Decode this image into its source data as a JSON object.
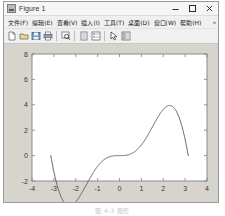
{
  "window": {
    "title": "Figure 1",
    "icon": "matlab-figure-icon",
    "controls": [
      {
        "name": "minimize-button",
        "glyph": "minimize-icon"
      },
      {
        "name": "maximize-button",
        "glyph": "maximize-icon"
      },
      {
        "name": "close-button",
        "glyph": "close-icon"
      }
    ]
  },
  "menubar": {
    "items": [
      {
        "name": "menu-file",
        "label": "文件(F)"
      },
      {
        "name": "menu-edit",
        "label": "编辑(E)"
      },
      {
        "name": "menu-view",
        "label": "查看(V)"
      },
      {
        "name": "menu-insert",
        "label": "插入(I)"
      },
      {
        "name": "menu-tools",
        "label": "工具(T)"
      },
      {
        "name": "menu-desktop",
        "label": "桌面(D)"
      },
      {
        "name": "menu-window",
        "label": "窗口(W)"
      },
      {
        "name": "menu-help",
        "label": "帮助(H)"
      }
    ],
    "overflow_label": "»"
  },
  "toolbar": {
    "buttons": [
      {
        "name": "new-figure-button",
        "icon": "new-document-icon"
      },
      {
        "name": "open-file-button",
        "icon": "open-folder-icon"
      },
      {
        "name": "save-figure-button",
        "icon": "save-disk-icon"
      },
      {
        "name": "print-figure-button",
        "icon": "printer-icon"
      },
      {
        "name": "zoom-in-button",
        "icon": "magnifier-plus-icon"
      },
      {
        "name": "data-cursor-button",
        "icon": "data-cursor-icon"
      },
      {
        "name": "insert-legend-button",
        "icon": "legend-icon"
      },
      {
        "name": "edit-plot-button",
        "icon": "arrow-pointer-icon"
      },
      {
        "name": "insert-colorbar-button",
        "icon": "colorbar-icon"
      }
    ]
  },
  "caption": {
    "text": "图 4-3  图形"
  },
  "chart_data": {
    "type": "line",
    "title": "",
    "xlabel": "",
    "ylabel": "",
    "xlim": [
      -4,
      4
    ],
    "ylim": [
      -2,
      8
    ],
    "xticks": [
      -4,
      -3,
      -2,
      -1,
      0,
      1,
      2,
      3,
      4
    ],
    "yticks": [
      -2,
      0,
      2,
      4,
      6,
      8
    ],
    "xticklabels": [
      "-4",
      "-3",
      "-2",
      "-1",
      "0",
      "1",
      "2",
      "3",
      "4"
    ],
    "yticklabels": [
      "-2",
      "0",
      "2",
      "4",
      "6",
      "8"
    ],
    "grid": false,
    "legend": null,
    "box": true,
    "line_color": "#555555",
    "axes_color": "#808080",
    "axes_bg": "#ffffff",
    "figure_bg": "#d7d4cd",
    "series": [
      {
        "name": "x^2*sin(x)",
        "x": [
          -3.1416,
          -3.0,
          -2.8,
          -2.6,
          -2.4,
          -2.2,
          -2.0,
          -1.8,
          -1.6,
          -1.4,
          -1.2,
          -1.0,
          -0.8,
          -0.6,
          -0.4,
          -0.2,
          0.0,
          0.2,
          0.4,
          0.6,
          0.8,
          1.0,
          1.2,
          1.4,
          1.6,
          1.8,
          2.0,
          2.2,
          2.3,
          2.4,
          2.6,
          2.8,
          3.0,
          3.1416
        ],
        "y": [
          0.0,
          -1.39,
          -2.64,
          -3.49,
          -3.89,
          -3.91,
          -3.64,
          -3.16,
          -2.56,
          -1.93,
          -1.34,
          -0.84,
          -0.46,
          -0.2,
          -0.06,
          -0.01,
          0.0,
          0.008,
          0.062,
          0.203,
          0.459,
          0.841,
          1.342,
          1.932,
          2.56,
          3.155,
          3.637,
          3.906,
          3.95,
          3.887,
          3.491,
          2.642,
          1.27,
          0.0
        ]
      }
    ],
    "peak": {
      "x": 2.29,
      "y": 7.5
    }
  }
}
